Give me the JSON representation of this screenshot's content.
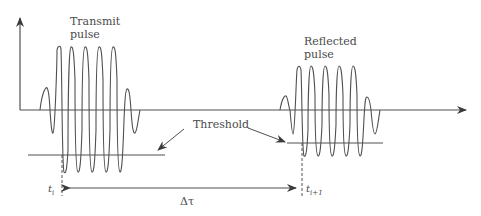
{
  "labels": {
    "transmit_line1": "Transmit",
    "transmit_line2": "pulse",
    "reflected_line1": "Reflected",
    "reflected_line2": "pulse",
    "threshold": "Threshold",
    "delta_tau": "Δτ",
    "t_i_base": "t",
    "t_i_sub": "i",
    "t_i1_base": "t",
    "t_i1_sub": "i+1"
  },
  "colors": {
    "stroke": "#505050",
    "text": "#4a4a4a",
    "background": "#ffffff"
  },
  "diagram": {
    "transmit_pulse": {
      "cycles": 7,
      "x_start": 40,
      "x_end": 140
    },
    "reflected_pulse": {
      "cycles": 7,
      "x_start": 280,
      "x_end": 380
    },
    "thresholds": [
      {
        "x1": 28,
        "x2": 165,
        "y": 155
      },
      {
        "x1": 287,
        "x2": 383,
        "y": 143
      }
    ]
  }
}
